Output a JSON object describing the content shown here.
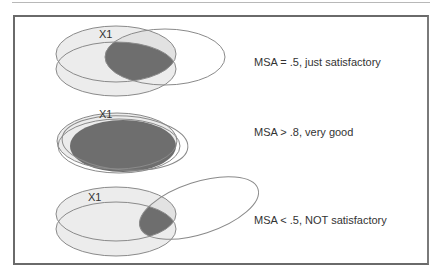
{
  "colors": {
    "stroke": "#8a8a8a",
    "light_fill": "#ececec",
    "dark_fill": "#6e6e6e",
    "text": "#333333",
    "frame": "#6a6a6a"
  },
  "panels": [
    {
      "variable_label": "X1",
      "caption": "MSA = .5, just satisfactory",
      "overlap": "partial"
    },
    {
      "variable_label": "X1",
      "caption": "MSA > .8, very good",
      "overlap": "high"
    },
    {
      "variable_label": "X1",
      "caption": "MSA < .5, NOT satisfactory",
      "overlap": "low"
    }
  ]
}
